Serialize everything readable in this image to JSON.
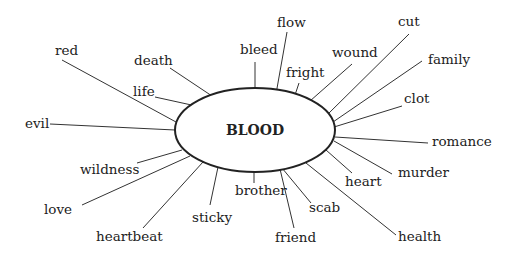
{
  "diagram": {
    "type": "word-association-spider",
    "center": {
      "label": "BLOOD",
      "cx": 255,
      "cy": 130,
      "rx": 80,
      "ry": 42
    },
    "colors": {
      "line": "#333333",
      "text": "#222222",
      "background": "#ffffff"
    },
    "nodes": [
      {
        "label": "red",
        "tx": 55,
        "ty": 55,
        "anchor": "start",
        "x1": 62,
        "y1": 60,
        "x2": 176,
        "y2": 122
      },
      {
        "label": "death",
        "tx": 134,
        "ty": 65,
        "anchor": "start",
        "x1": 170,
        "y1": 68,
        "x2": 215,
        "y2": 98
      },
      {
        "label": "life",
        "tx": 133,
        "ty": 96,
        "anchor": "start",
        "x1": 155,
        "y1": 97,
        "x2": 196,
        "y2": 106
      },
      {
        "label": "evil",
        "tx": 25,
        "ty": 128,
        "anchor": "start",
        "x1": 50,
        "y1": 124,
        "x2": 175,
        "y2": 130
      },
      {
        "label": "wildness",
        "tx": 80,
        "ty": 174,
        "anchor": "start",
        "x1": 137,
        "y1": 163,
        "x2": 182,
        "y2": 150
      },
      {
        "label": "love",
        "tx": 44,
        "ty": 214,
        "anchor": "start",
        "x1": 82,
        "y1": 205,
        "x2": 190,
        "y2": 156
      },
      {
        "label": "heartbeat",
        "tx": 96,
        "ty": 241,
        "anchor": "start",
        "x1": 143,
        "y1": 228,
        "x2": 203,
        "y2": 162
      },
      {
        "label": "sticky",
        "tx": 192,
        "ty": 222,
        "anchor": "start",
        "x1": 210,
        "y1": 205,
        "x2": 218,
        "y2": 167
      },
      {
        "label": "brother",
        "tx": 235,
        "ty": 195,
        "anchor": "start",
        "x1": 254,
        "y1": 183,
        "x2": 254,
        "y2": 172
      },
      {
        "label": "friend",
        "tx": 275,
        "ty": 242,
        "anchor": "start",
        "x1": 294,
        "y1": 228,
        "x2": 280,
        "y2": 169
      },
      {
        "label": "scab",
        "tx": 309,
        "ty": 212,
        "anchor": "start",
        "x1": 311,
        "y1": 203,
        "x2": 282,
        "y2": 168
      },
      {
        "label": "health",
        "tx": 398,
        "ty": 241,
        "anchor": "start",
        "x1": 396,
        "y1": 235,
        "x2": 306,
        "y2": 163
      },
      {
        "label": "heart",
        "tx": 345,
        "ty": 186,
        "anchor": "start",
        "x1": 352,
        "y1": 173,
        "x2": 326,
        "y2": 150
      },
      {
        "label": "murder",
        "tx": 398,
        "ty": 177,
        "anchor": "start",
        "x1": 392,
        "y1": 174,
        "x2": 334,
        "y2": 141
      },
      {
        "label": "romance",
        "tx": 432,
        "ty": 146,
        "anchor": "start",
        "x1": 428,
        "y1": 143,
        "x2": 335,
        "y2": 137
      },
      {
        "label": "clot",
        "tx": 404,
        "ty": 103,
        "anchor": "start",
        "x1": 402,
        "y1": 106,
        "x2": 334,
        "y2": 127
      },
      {
        "label": "family",
        "tx": 428,
        "ty": 64,
        "anchor": "start",
        "x1": 422,
        "y1": 61,
        "x2": 333,
        "y2": 122
      },
      {
        "label": "cut",
        "tx": 398,
        "ty": 26,
        "anchor": "start",
        "x1": 409,
        "y1": 34,
        "x2": 328,
        "y2": 114
      },
      {
        "label": "wound",
        "tx": 332,
        "ty": 57,
        "anchor": "start",
        "x1": 352,
        "y1": 64,
        "x2": 310,
        "y2": 101
      },
      {
        "label": "fright",
        "tx": 286,
        "ty": 77,
        "anchor": "start",
        "x1": 299,
        "y1": 83,
        "x2": 294,
        "y2": 98
      },
      {
        "label": "flow",
        "tx": 277,
        "ty": 27,
        "anchor": "start",
        "x1": 287,
        "y1": 32,
        "x2": 276,
        "y2": 94
      },
      {
        "label": "bleed",
        "tx": 240,
        "ty": 54,
        "anchor": "start",
        "x1": 255,
        "y1": 62,
        "x2": 255,
        "y2": 89
      }
    ]
  }
}
